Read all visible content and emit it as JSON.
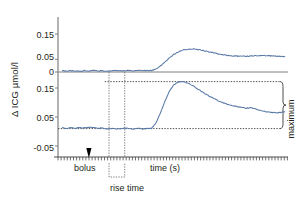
{
  "chart_data": {
    "type": "line",
    "title": "",
    "xlabel": "time (s)",
    "ylabel": "Δ ICG µmol/l",
    "grid": false,
    "legend": "none",
    "series_color": "#5a7aa8",
    "axis_color": "#808080",
    "panels": [
      {
        "name": "upper-panel",
        "ytick_labels": [
          "0.15",
          "0.05",
          "0"
        ],
        "ytick_values": [
          0.15,
          0.05,
          0
        ],
        "ylim": [
          -0.02,
          0.2
        ],
        "xlim": [
          0,
          100
        ],
        "x": [
          0,
          2,
          4,
          6,
          8,
          10,
          12,
          14,
          16,
          18,
          20,
          22,
          24,
          26,
          28,
          30,
          32,
          34,
          36,
          38,
          40,
          42,
          44,
          46,
          48,
          50,
          52,
          54,
          56,
          58,
          60,
          62,
          64,
          66,
          68,
          70,
          72,
          74,
          76,
          78,
          80,
          82,
          84,
          86,
          88,
          90,
          92,
          94,
          96,
          98,
          100
        ],
        "y": [
          0.004,
          0.003,
          0.005,
          0.004,
          0.003,
          0.005,
          0.004,
          0.006,
          0.004,
          0.005,
          0.004,
          0.005,
          0.006,
          0.005,
          0.004,
          0.006,
          0.005,
          0.005,
          0.006,
          0.005,
          0.006,
          0.012,
          0.024,
          0.04,
          0.056,
          0.07,
          0.08,
          0.087,
          0.09,
          0.091,
          0.09,
          0.087,
          0.083,
          0.079,
          0.075,
          0.071,
          0.068,
          0.066,
          0.064,
          0.063,
          0.062,
          0.062,
          0.063,
          0.064,
          0.065,
          0.065,
          0.064,
          0.063,
          0.062,
          0.061,
          0.06
        ]
      },
      {
        "name": "lower-panel",
        "ytick_labels": [
          "0.15",
          "0.05",
          "-0.05"
        ],
        "ytick_values": [
          0.15,
          0.05,
          -0.05
        ],
        "ylim": [
          -0.06,
          0.2
        ],
        "xlim": [
          0,
          100
        ],
        "x": [
          0,
          2,
          4,
          6,
          8,
          10,
          12,
          14,
          16,
          18,
          20,
          22,
          24,
          26,
          28,
          30,
          32,
          34,
          36,
          38,
          40,
          42,
          44,
          46,
          48,
          50,
          52,
          54,
          56,
          58,
          60,
          62,
          64,
          66,
          68,
          70,
          72,
          74,
          76,
          78,
          80,
          82,
          84,
          86,
          88,
          90,
          92,
          94,
          96,
          98,
          100
        ],
        "y": [
          0.012,
          0.01,
          0.013,
          0.011,
          0.014,
          0.012,
          0.015,
          0.013,
          0.011,
          0.012,
          0.01,
          0.011,
          0.009,
          0.01,
          0.011,
          0.01,
          0.009,
          0.01,
          0.009,
          0.01,
          0.011,
          0.03,
          0.065,
          0.105,
          0.14,
          0.162,
          0.171,
          0.172,
          0.168,
          0.16,
          0.15,
          0.14,
          0.13,
          0.121,
          0.113,
          0.105,
          0.099,
          0.094,
          0.09,
          0.086,
          0.083,
          0.08,
          0.082,
          0.079,
          0.074,
          0.07,
          0.067,
          0.065,
          0.064,
          0.066,
          0.068
        ],
        "baseline_value": 0.01,
        "maximum_value": 0.172
      }
    ],
    "annotations": [
      {
        "name": "bolus",
        "text": "bolus",
        "marker": "down-arrow",
        "x": 12
      },
      {
        "name": "time-axis",
        "text": "time (s)"
      },
      {
        "name": "rise-time",
        "text": "rise time",
        "x_start": 21,
        "x_end": 28
      },
      {
        "name": "maximum",
        "text": "maximum",
        "from": 0.01,
        "to": 0.172
      }
    ]
  }
}
